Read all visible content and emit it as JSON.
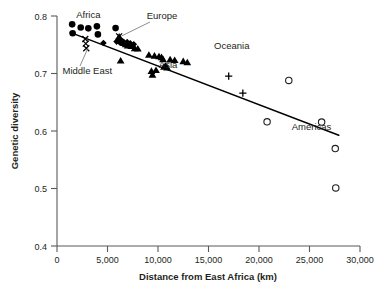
{
  "chart_data": {
    "type": "scatter",
    "title": "",
    "xlabel": "Distance from East Africa (km)",
    "ylabel": "Genetic diversity",
    "xlim": [
      0,
      30000
    ],
    "ylim": [
      0.4,
      0.8
    ],
    "xticks": [
      0,
      5000,
      10000,
      15000,
      20000,
      25000,
      30000
    ],
    "xticklabels": [
      "0",
      "5,000",
      "10,000",
      "15,000",
      "20,000",
      "25,000",
      "30,000"
    ],
    "yticks": [
      0.4,
      0.5,
      0.6,
      0.7,
      0.8
    ],
    "yticklabels": [
      "0.4",
      "0.5",
      "0.6",
      "0.7",
      "0.8"
    ],
    "grid": false,
    "legend_position": "none",
    "annotations": [
      {
        "text": "Africa",
        "x": 3100,
        "y": 0.797,
        "marker": "filled-circle"
      },
      {
        "text": "Middle East",
        "x": 3000,
        "y": 0.699,
        "marker": "x-mark"
      },
      {
        "text": "Europe",
        "x": 10400,
        "y": 0.795,
        "marker": "diamond"
      },
      {
        "text": "Asia",
        "x": 11000,
        "y": 0.709,
        "marker": "triangle"
      },
      {
        "text": "Oceania",
        "x": 17300,
        "y": 0.742,
        "marker": "plus"
      },
      {
        "text": "Americas",
        "x": 25200,
        "y": 0.602,
        "marker": "open-circle"
      }
    ],
    "trendline": {
      "x0": 1300,
      "y0": 0.7715,
      "x1": 27900,
      "y1": 0.5925
    },
    "series": [
      {
        "name": "Africa",
        "marker": "filled-circle",
        "points": [
          [
            1500,
            0.7855
          ],
          [
            1550,
            0.77
          ],
          [
            2350,
            0.78
          ],
          [
            3100,
            0.7785
          ],
          [
            3950,
            0.782
          ],
          [
            4050,
            0.768
          ],
          [
            5800,
            0.779
          ]
        ]
      },
      {
        "name": "Middle East",
        "marker": "x-mark",
        "points": [
          [
            2800,
            0.76
          ],
          [
            2850,
            0.752
          ],
          [
            2900,
            0.744
          ],
          [
            6150,
            0.7645
          ]
        ]
      },
      {
        "name": "Europe",
        "marker": "diamond",
        "points": [
          [
            4600,
            0.753
          ],
          [
            5900,
            0.7555
          ],
          [
            6100,
            0.76
          ],
          [
            6250,
            0.7535
          ],
          [
            6400,
            0.757
          ],
          [
            6600,
            0.755
          ],
          [
            6950,
            0.7545
          ],
          [
            7250,
            0.7525
          ],
          [
            7600,
            0.751
          ]
        ]
      },
      {
        "name": "Asia",
        "marker": "triangle",
        "points": [
          [
            6150,
            0.764
          ],
          [
            6300,
            0.759
          ],
          [
            6450,
            0.756
          ],
          [
            6600,
            0.753
          ],
          [
            6800,
            0.751
          ],
          [
            7000,
            0.749
          ],
          [
            6300,
            0.7225
          ],
          [
            7350,
            0.748
          ],
          [
            7700,
            0.744
          ],
          [
            8000,
            0.7435
          ],
          [
            9100,
            0.7325
          ],
          [
            9350,
            0.7045
          ],
          [
            9450,
            0.698
          ],
          [
            9650,
            0.731
          ],
          [
            9800,
            0.706
          ],
          [
            10100,
            0.73
          ],
          [
            10350,
            0.7285
          ],
          [
            10500,
            0.725
          ],
          [
            10600,
            0.712
          ],
          [
            10750,
            0.7135
          ],
          [
            10900,
            0.7105
          ],
          [
            11200,
            0.7245
          ],
          [
            11650,
            0.7235
          ],
          [
            12500,
            0.7215
          ],
          [
            12900,
            0.7195
          ]
        ]
      },
      {
        "name": "Oceania",
        "marker": "plus",
        "points": [
          [
            17000,
            0.6955
          ],
          [
            18400,
            0.666
          ]
        ]
      },
      {
        "name": "Americas",
        "marker": "open-circle",
        "points": [
          [
            20800,
            0.616
          ],
          [
            22950,
            0.688
          ],
          [
            26200,
            0.6155
          ],
          [
            27550,
            0.5695
          ],
          [
            27600,
            0.501
          ]
        ]
      }
    ]
  }
}
